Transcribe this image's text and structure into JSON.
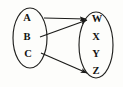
{
  "diagram": {
    "stroke_color": "#1b1b19",
    "background_color": "#fdfdfb",
    "domain_set": {
      "name": "domain-set",
      "elements": [
        {
          "label": "A",
          "x": 27,
          "y": 19
        },
        {
          "label": "B",
          "x": 27,
          "y": 38
        },
        {
          "label": "C",
          "x": 28,
          "y": 55
        }
      ],
      "ellipse": {
        "cx": 30,
        "cy": 38,
        "rx": 17,
        "ry": 30
      }
    },
    "codomain_set": {
      "name": "codomain-set",
      "elements": [
        {
          "label": "W",
          "x": 97,
          "y": 20
        },
        {
          "label": "X",
          "x": 96,
          "y": 38
        },
        {
          "label": "Y",
          "x": 96,
          "y": 55
        },
        {
          "label": "Z",
          "x": 96,
          "y": 72
        }
      ],
      "ellipse": {
        "cx": 96,
        "cy": 45,
        "rx": 17,
        "ry": 33
      }
    },
    "arrows": [
      {
        "name": "arrow-a-to-w",
        "from": "A",
        "to": "W",
        "x1": 44,
        "y1": 18,
        "x2": 86,
        "y2": 19
      },
      {
        "name": "arrow-b-to-w",
        "from": "B",
        "to": "W",
        "x1": 40,
        "y1": 37,
        "x2": 87,
        "y2": 20
      },
      {
        "name": "arrow-c-to-z",
        "from": "C",
        "to": "Z",
        "x1": 41,
        "y1": 53,
        "x2": 87,
        "y2": 73
      }
    ]
  }
}
